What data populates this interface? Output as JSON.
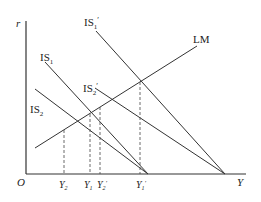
{
  "diagram": {
    "type": "IS-LM",
    "axes": {
      "y_label": "r",
      "x_label": "Y",
      "origin_label": "O"
    },
    "curves": [
      {
        "id": "IS1",
        "label": "IS",
        "sub": "1",
        "prime": ""
      },
      {
        "id": "IS1p",
        "label": "IS",
        "sub": "1",
        "prime": "′"
      },
      {
        "id": "IS2",
        "label": "IS",
        "sub": "2",
        "prime": ""
      },
      {
        "id": "IS2p",
        "label": "IS",
        "sub": "2",
        "prime": "′"
      },
      {
        "id": "LM",
        "label": "LM",
        "sub": "",
        "prime": ""
      }
    ],
    "x_ticks": [
      {
        "label": "Y",
        "sub": "2",
        "prime": ""
      },
      {
        "label": "Y",
        "sub": "1",
        "prime": ""
      },
      {
        "label": "Y",
        "sub": "2",
        "prime": "′"
      },
      {
        "label": "Y",
        "sub": "1",
        "prime": "′"
      }
    ],
    "colors": {
      "line": "#333333",
      "dashed": "#444444",
      "text": "#222222"
    }
  }
}
